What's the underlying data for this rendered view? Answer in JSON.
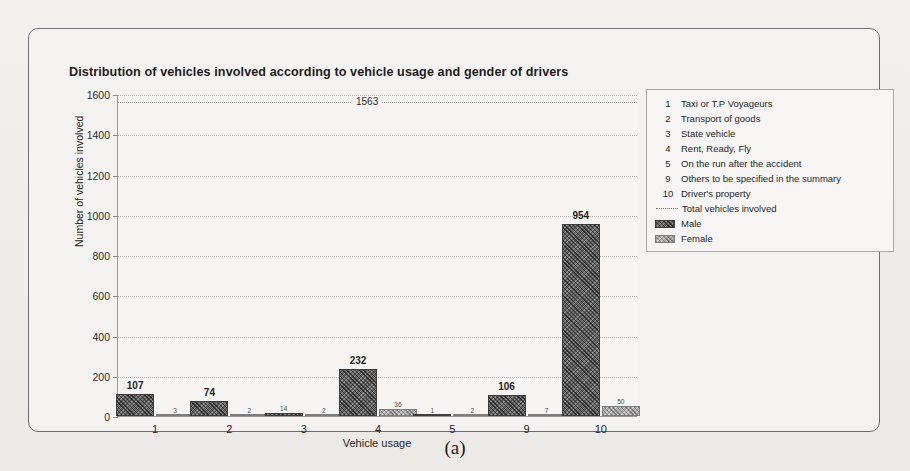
{
  "figure": {
    "caption": "(a)",
    "title": "Distribution of vehicles involved according to vehicle usage and gender of drivers"
  },
  "legend": {
    "codes": [
      {
        "key": "1",
        "label": "Taxi or T.P Voyageurs"
      },
      {
        "key": "2",
        "label": "Transport of goods"
      },
      {
        "key": "3",
        "label": "State vehicle"
      },
      {
        "key": "4",
        "label": "Rent, Ready, Fly"
      },
      {
        "key": "5",
        "label": "On the run after the accident"
      },
      {
        "key": "9",
        "label": "Others to be specified in the summary"
      },
      {
        "key": "10",
        "label": "Driver's property"
      }
    ],
    "series": [
      {
        "marker": "dotted-line",
        "label": "Total vehicles involved"
      },
      {
        "marker": "swatch-male",
        "label": "Male"
      },
      {
        "marker": "swatch-female",
        "label": "Female"
      }
    ]
  },
  "colors": {
    "male": "#5e5e5e",
    "female": "#a8a8a8",
    "grid": "#b4b4b4",
    "axis": "#9a9a9a",
    "frame": "#6d6d6d"
  },
  "chart_data": {
    "type": "bar",
    "title": "Distribution of vehicles involved according to vehicle usage and gender of drivers",
    "xlabel": "Vehicle usage",
    "ylabel": "Number of vehicles involved",
    "categories": [
      "1",
      "2",
      "3",
      "4",
      "5",
      "9",
      "10"
    ],
    "series": [
      {
        "name": "Male",
        "values": [
          107,
          74,
          14,
          232,
          1,
          106,
          954
        ]
      },
      {
        "name": "Female",
        "values": [
          3,
          2,
          2,
          36,
          2,
          7,
          50
        ]
      }
    ],
    "reference_line": {
      "label": "1563",
      "value": 1563,
      "name": "Total vehicles involved",
      "style": "dotted"
    },
    "ylim": [
      0,
      1600
    ],
    "yticks": [
      0,
      200,
      400,
      600,
      800,
      1000,
      1200,
      1400,
      1600
    ],
    "ytick_labels": [
      "0",
      "200",
      "400",
      "600",
      "800",
      "1000",
      "1200",
      "1400",
      "1600"
    ],
    "grid": true,
    "legend_position": "right"
  }
}
